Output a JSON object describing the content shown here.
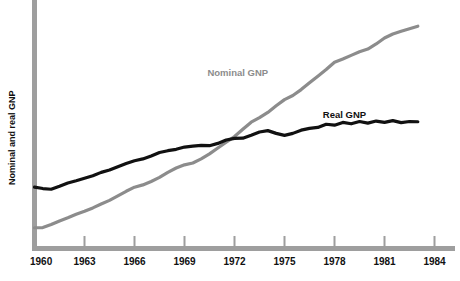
{
  "chart_data": {
    "type": "line",
    "title": "",
    "subtitle": "",
    "xlabel": "",
    "ylabel": "Nominal and real GNP",
    "xlim": [
      1960,
      1984
    ],
    "ylim": [
      0,
      100
    ],
    "grid": false,
    "legend_position": "inline-annotations",
    "x_tick_labels": [
      "1960",
      "1963",
      "1966",
      "1969",
      "1972",
      "1975",
      "1978",
      "1981",
      "1984"
    ],
    "x_ticks": [
      1960,
      1963,
      1966,
      1969,
      1972,
      1975,
      1978,
      1981,
      1984
    ],
    "y_tick_labels": [],
    "annotations": [
      {
        "name": "nominal-gnp-label",
        "text": "Nominal GNP",
        "x": 1972.2,
        "y": 74.5,
        "color": "#8c8c8c"
      },
      {
        "name": "real-gnp-label",
        "text": "Real GNP",
        "x": 1978.6,
        "y": 56.0,
        "color": "#111111"
      }
    ],
    "series": [
      {
        "name": "Nominal GNP",
        "color": "#8c8c8c",
        "x": [
          1960.0,
          1960.5,
          1961.0,
          1961.5,
          1962.0,
          1962.5,
          1963.0,
          1963.5,
          1964.0,
          1964.5,
          1965.0,
          1965.5,
          1966.0,
          1966.5,
          1967.0,
          1967.5,
          1968.0,
          1968.5,
          1969.0,
          1969.5,
          1970.0,
          1970.5,
          1971.0,
          1971.5,
          1972.0,
          1972.5,
          1973.0,
          1973.5,
          1974.0,
          1974.5,
          1975.0,
          1975.5,
          1976.0,
          1976.5,
          1977.0,
          1977.5,
          1978.0,
          1978.5,
          1979.0,
          1979.5,
          1980.0,
          1980.5,
          1981.0,
          1981.5,
          1982.0,
          1982.5,
          1983.0
        ],
        "values": [
          8.0,
          8.1,
          9.4,
          11.0,
          12.4,
          13.9,
          15.2,
          16.7,
          18.4,
          20.0,
          22.0,
          24.0,
          25.8,
          26.8,
          28.3,
          30.1,
          32.3,
          34.2,
          35.6,
          36.4,
          38.2,
          40.4,
          43.0,
          45.5,
          48.0,
          51.2,
          54.3,
          56.3,
          58.6,
          61.5,
          64.2,
          66.0,
          68.6,
          71.6,
          74.5,
          77.4,
          80.6,
          82.0,
          83.6,
          85.2,
          86.4,
          88.6,
          91.2,
          93.0,
          94.2,
          95.3,
          96.4
        ]
      },
      {
        "name": "Real GNP",
        "color": "#111111",
        "x": [
          1960.0,
          1960.5,
          1961.0,
          1961.5,
          1962.0,
          1962.5,
          1963.0,
          1963.5,
          1964.0,
          1964.5,
          1965.0,
          1965.5,
          1966.0,
          1966.5,
          1967.0,
          1967.5,
          1968.0,
          1968.5,
          1969.0,
          1969.5,
          1970.0,
          1970.5,
          1971.0,
          1971.5,
          1972.0,
          1972.5,
          1973.0,
          1973.5,
          1974.0,
          1974.5,
          1975.0,
          1975.5,
          1976.0,
          1976.5,
          1977.0,
          1977.5,
          1978.0,
          1978.5,
          1979.0,
          1979.5,
          1980.0,
          1980.5,
          1981.0,
          1981.5,
          1982.0,
          1982.5,
          1983.0
        ],
        "values": [
          25.8,
          25.2,
          24.9,
          26.2,
          27.6,
          28.6,
          29.7,
          30.8,
          32.3,
          33.3,
          34.8,
          36.2,
          37.4,
          38.2,
          39.5,
          41.0,
          41.8,
          42.4,
          43.4,
          43.8,
          44.1,
          44.0,
          45.0,
          46.5,
          47.2,
          47.3,
          48.6,
          50.0,
          50.6,
          49.4,
          48.5,
          49.4,
          50.8,
          51.6,
          52.0,
          53.4,
          53.0,
          54.2,
          53.6,
          54.6,
          53.9,
          54.8,
          54.2,
          55.0,
          54.1,
          54.6,
          54.5
        ]
      }
    ]
  },
  "axes": {
    "vertical_axis_color": "#9e9e9e",
    "horizontal_axis_color": "#9e9e9e",
    "tick_color": "#9e9e9e"
  }
}
